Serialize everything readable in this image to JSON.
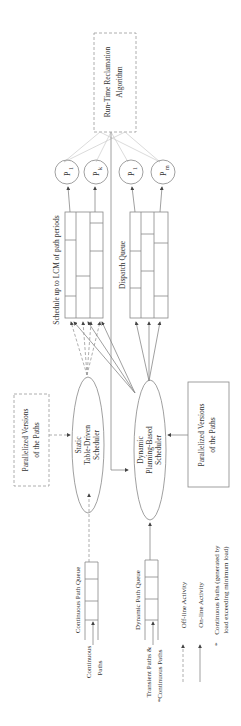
{
  "diagram": {
    "orientation": "rotated-90-ccw",
    "rtra": {
      "label_line1": "Run-Time Reclamation",
      "label_line2": "Algorithm"
    },
    "processors_static": [
      {
        "base": "P",
        "sub": "1"
      },
      {
        "base": "P",
        "sub": "k"
      }
    ],
    "processors_dynamic": [
      {
        "base": "P",
        "sub": "1"
      },
      {
        "base": "P",
        "sub": "m"
      }
    ],
    "static_schedule": {
      "label": "Schedule up to LCM of path periods"
    },
    "dispatch_queue": {
      "label": "Dispatch Queue"
    },
    "static_scheduler": {
      "line1": "Static",
      "line2": "Table-Driven",
      "line3": "Scheduler"
    },
    "dynamic_scheduler": {
      "line1": "Dynamic",
      "line2": "Planning-Based",
      "line3": "Scheduler"
    },
    "par_versions_offline": {
      "line1": "Parallelized Versions",
      "line2": "of the Paths"
    },
    "par_versions_online": {
      "line1": "Parallelized Versions",
      "line2": "of the Paths"
    },
    "continuous_queue": {
      "label": "Continuous Path Queue",
      "input_line1": "Continuous",
      "input_line2": "Paths"
    },
    "dynamic_queue": {
      "label": "Dynamic Path Queue",
      "input_line1": "Transient Paths &",
      "input_line2": "*Continuous Paths"
    },
    "legend": {
      "offline": "Off-line Activity",
      "online": "On-line Activity",
      "star_symbol": "*",
      "star_line1": "Continuous Paths (generated by",
      "star_line2": "load exceeding minimum load)"
    }
  }
}
